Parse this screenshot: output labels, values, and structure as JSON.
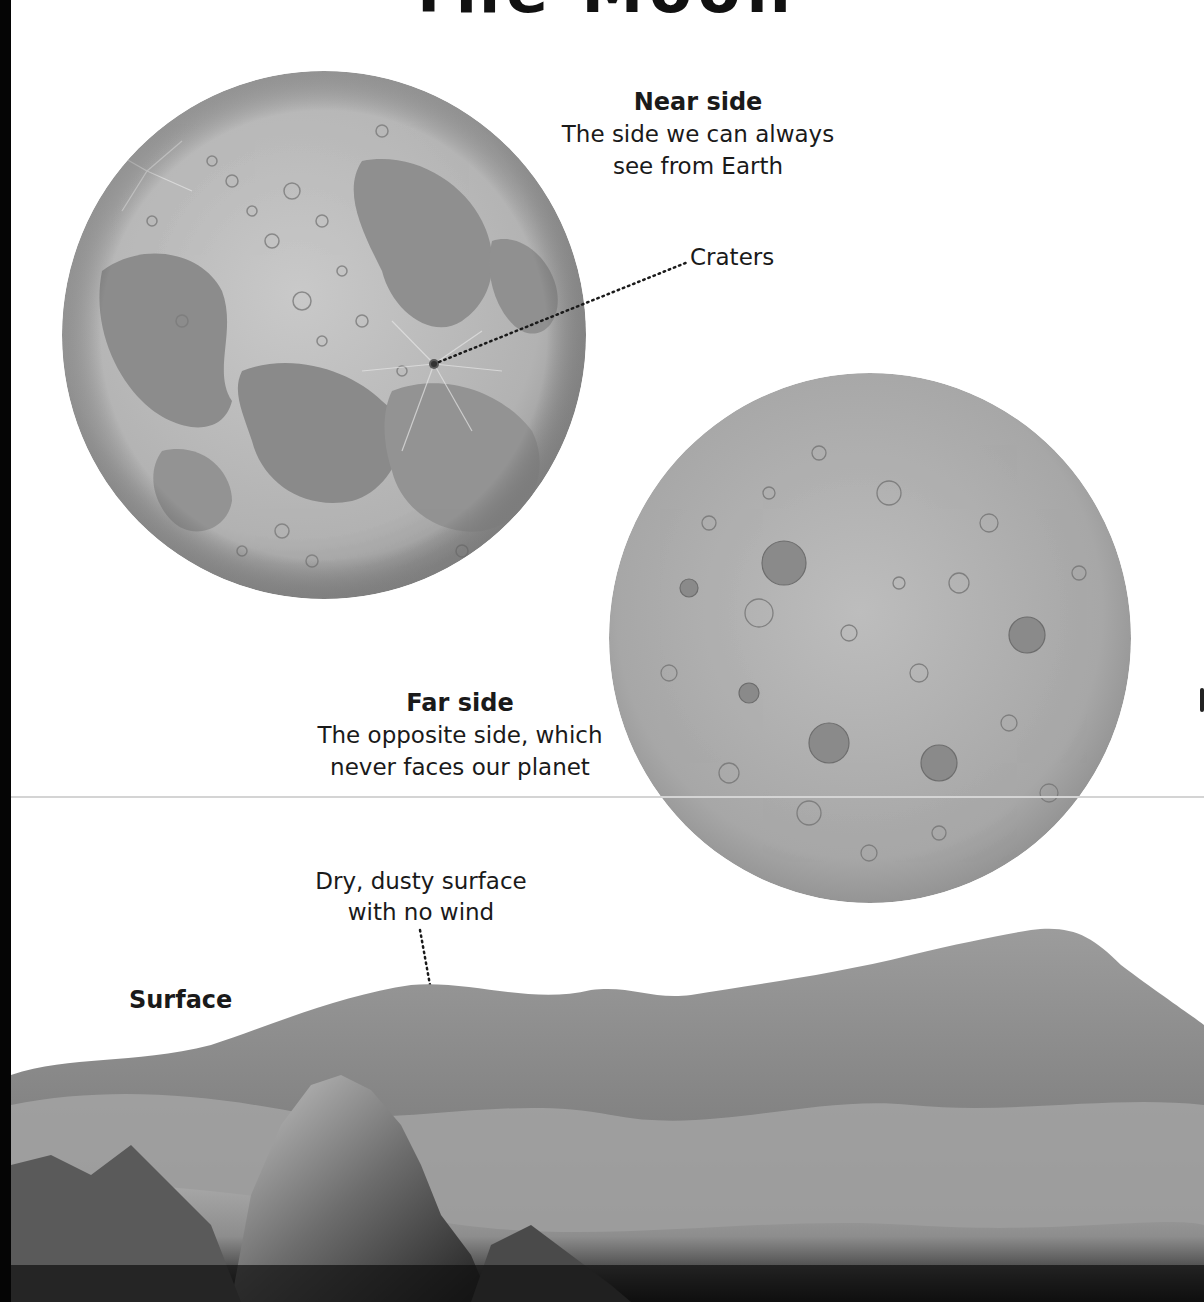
{
  "page": {
    "title": "The Moon"
  },
  "near_side": {
    "heading": "Near side",
    "description_line1": "The side we can always",
    "description_line2": "see from Earth",
    "callout": "Craters"
  },
  "far_side": {
    "heading": "Far side",
    "description_line1": "The opposite side, which",
    "description_line2": "never faces our planet"
  },
  "surface": {
    "heading": "Surface",
    "callout_line1": "Dry, dusty surface",
    "callout_line2": "with no wind"
  },
  "colors": {
    "background": "#ffffff",
    "text": "#1a1a1a",
    "moon_highland": "#b8b8b8",
    "moon_mare": "#8a8a8a",
    "divider": "#d4d4d4",
    "edge": "#050505"
  },
  "images": {
    "near_moon": "near-side-moon-illustration",
    "far_moon": "far-side-moon-illustration",
    "landscape": "lunar-surface-landscape-illustration"
  }
}
